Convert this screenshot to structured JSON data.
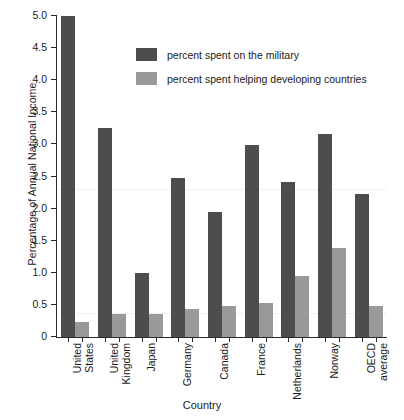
{
  "chart_data": {
    "type": "bar",
    "title": "",
    "xlabel": "Country",
    "ylabel": "Percentage of Annual National Income",
    "ylim": [
      0,
      5.0
    ],
    "ytick_labels": [
      "0",
      "0.5",
      "1.0",
      "1.5",
      "2.0",
      "2.5",
      "3.0",
      "3.5",
      "4.0",
      "4.5",
      "5.0"
    ],
    "ytick_values": [
      0,
      0.5,
      1.0,
      1.5,
      2.0,
      2.5,
      3.0,
      3.5,
      4.0,
      4.5,
      5.0
    ],
    "grid": false,
    "legend_position": "upper-center",
    "categories": [
      "United States",
      "United Kingdom",
      "Japan",
      "Germany",
      "Canada",
      "France",
      "Netherlands",
      "Norway",
      "OECD average"
    ],
    "category_lines": [
      [
        "United",
        "States"
      ],
      [
        "United",
        "Kingdom"
      ],
      [
        "Japan",
        ""
      ],
      [
        "Germany",
        ""
      ],
      [
        "Canada",
        ""
      ],
      [
        "France",
        ""
      ],
      [
        "Netherlands",
        ""
      ],
      [
        "Norway",
        ""
      ],
      [
        "OECD",
        "average"
      ]
    ],
    "series": [
      {
        "name": "percent spent on the military",
        "color": "#4d4d4d",
        "values": [
          5.0,
          3.25,
          0.99,
          2.48,
          1.95,
          2.99,
          2.42,
          3.17,
          2.23
        ]
      },
      {
        "name": "percent spent helping developing countries",
        "color": "#999999",
        "values": [
          0.23,
          0.36,
          0.36,
          0.43,
          0.48,
          0.53,
          0.95,
          1.38,
          0.48
        ]
      }
    ]
  },
  "legend": {
    "items": [
      {
        "label": "percent spent on the military",
        "color": "#4d4d4d"
      },
      {
        "label": "percent spent helping developing countries",
        "color": "#999999"
      }
    ]
  },
  "axes": {
    "y_title": "Percentage of Annual National Income",
    "x_title": "Country"
  }
}
